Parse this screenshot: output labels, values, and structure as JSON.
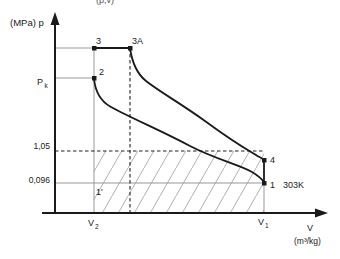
{
  "diagram": {
    "cropped_top_text": "(p,v)",
    "y_axis_label": "(MPa) p",
    "x_axis_label": "V",
    "x_axis_units": "(m³/kg)",
    "pressures": {
      "pk_base": "P",
      "pk_sub": "k",
      "mid": "1,05",
      "low": "0,096"
    },
    "points": {
      "p3": "3",
      "p3a": "3A",
      "p2": "2",
      "p4": "4",
      "p1": "1",
      "p1prime": "1'",
      "isotherm": "303K"
    },
    "volumes": {
      "v2_base": "V",
      "v2_sub": "2",
      "v1_base": "V",
      "v1_sub": "1"
    },
    "colors": {
      "curve": "#1a1a1a",
      "reference_line": "#999999",
      "dashed_line": "#222222",
      "hatch": "#a8a8a8",
      "background": "#ffffff"
    }
  }
}
